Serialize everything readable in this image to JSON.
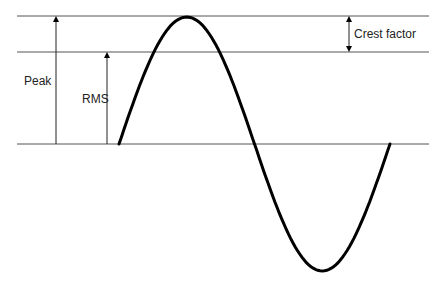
{
  "diagram": {
    "labels": {
      "peak": "Peak",
      "rms": "RMS",
      "crest_factor": "Crest factor"
    },
    "reference_lines": [
      {
        "name": "peak-level",
        "y": 16
      },
      {
        "name": "rms-level",
        "y": 52
      },
      {
        "name": "zero-baseline",
        "y": 144
      }
    ],
    "waveform": {
      "type": "sine",
      "start_x": 119,
      "end_x": 390,
      "baseline_y": 144,
      "amplitude_px": 127,
      "cycles": 1
    },
    "colors": {
      "line": "#555555",
      "wave": "#000000",
      "text": "#222222"
    }
  }
}
